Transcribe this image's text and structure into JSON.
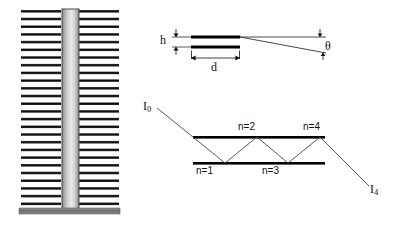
{
  "figure": {
    "background_color": "#ffffff",
    "ink_color": "#000000"
  },
  "panels": {
    "left_fin_structure": {
      "name": "fin-stack-structure",
      "description": "Vertical gradient post flanked by stacks of horizontal fins on a base bar",
      "fin_count_per_side": 26,
      "fin_color": "#1a1a1a",
      "post_color_light": "#e8e8e8",
      "post_color_dark": "#8a8a8a",
      "base_color": "#6f6f6f"
    },
    "top_right_film": {
      "name": "thin-film-geometry",
      "labels": {
        "h": "h",
        "d": "d",
        "theta": "θ"
      },
      "plate_color": "#000000"
    },
    "bottom_right_rays": {
      "name": "multiple-reflection-raypath",
      "labels": {
        "incident": "I",
        "incident_sub": "0",
        "exit": "I",
        "exit_sub": "4",
        "bounces": [
          "n=1",
          "n=2",
          "n=3",
          "n=4"
        ]
      },
      "mirror_color": "#000000",
      "ray_color": "#3a3a3a"
    }
  }
}
